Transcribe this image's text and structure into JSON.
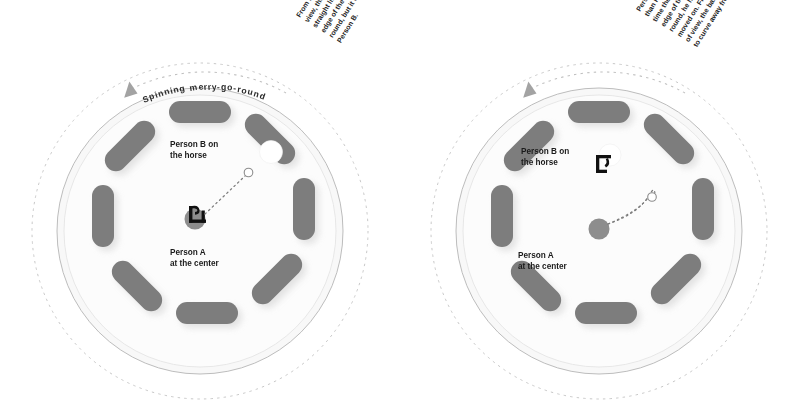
{
  "figure": {
    "title_visible": false,
    "background_color": "#ffffff",
    "panels": [
      {
        "id": "left",
        "name": "inertial-frame-view",
        "rotation_label": "Spinning merry-go-round",
        "rotation_direction": "counter-clockwise",
        "person_b_label_line1": "Person B on",
        "person_b_label_line2": "the horse",
        "person_a_label_line1": "Person A",
        "person_a_label_line2": "at the center",
        "annotation_lines": [
          "From Person A's point of",
          "view, the ball goes in a",
          "straight line toward the",
          "edge of the merry-go-",
          "round, but it won't reach",
          "Person B."
        ],
        "ball_path": "straight",
        "person_a_marker": "person-throwing-figure",
        "person_b_marker": "white-ball-on-horse"
      },
      {
        "id": "right",
        "name": "rotating-frame-view",
        "rotation_label": "",
        "rotation_direction": "counter-clockwise",
        "person_b_label_line1": "Person B on",
        "person_b_label_line2": "the horse",
        "person_a_label_line1": "Person A",
        "person_a_label_line2": "at the center",
        "annotation_lines": [
          "Person B is moving faster",
          "than Person A, so by the",
          "time the ball reaches the",
          "edge of the merry-go-",
          "round, he has already",
          "moved on. From his point",
          "of view, the ball appears",
          "to curve away from him."
        ],
        "ball_path": "curved",
        "person_a_marker": "gray-dot",
        "person_b_marker": "person-figure-on-horse"
      }
    ],
    "colors": {
      "horse": "#7d7d7d",
      "horse_shadow": "#d8d8d8",
      "platform_fill": "#f7f7f7",
      "platform_stroke": "#b9b9b9",
      "dashed_orbit": "#c2c2c2",
      "ball_outline": "#8c8c8c",
      "ball_fill": "#ffffff",
      "path_dots": "#7a7a7a",
      "figure": "#111111",
      "text": "#1b1b1b",
      "arrow": "#9a9a9a"
    },
    "horse_count": 8
  }
}
